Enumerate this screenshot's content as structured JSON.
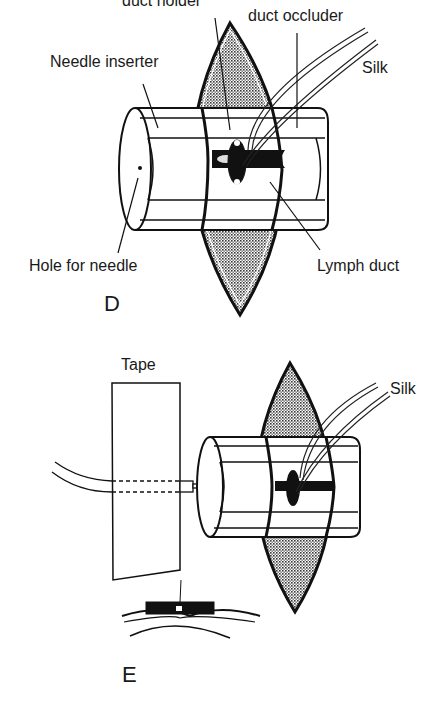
{
  "figure": {
    "panels": [
      {
        "id": "D",
        "letter": "D",
        "labels": {
          "duct_holder": "duct holder",
          "duct_occluder": "duct occluder",
          "needle_inserter": "Needle inserter",
          "silk": "Silk",
          "hole_for_needle": "Hole for needle",
          "lymph_duct": "Lymph duct"
        }
      },
      {
        "id": "E",
        "letter": "E",
        "labels": {
          "tape": "Tape",
          "silk": "Silk"
        }
      }
    ]
  },
  "colors": {
    "ink": "#1a1a1a",
    "background": "#ffffff",
    "stipple": "#555555"
  }
}
